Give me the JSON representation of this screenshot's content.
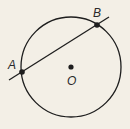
{
  "diagram": {
    "background": "#f3efe6",
    "stroke": "#1e1e1e",
    "circle": {
      "center_label": "O",
      "cx": 71,
      "cy": 67,
      "r": 50
    },
    "line": {
      "x1": 9,
      "y1": 80,
      "x2": 109,
      "y2": 17
    },
    "points": [
      {
        "label": "A",
        "x": 22,
        "y": 72,
        "label_x": 12,
        "label_y": 67
      },
      {
        "label": "B",
        "x": 97,
        "y": 25,
        "label_x": 97,
        "label_y": 14
      },
      {
        "label": "O",
        "x": 71,
        "y": 67,
        "label_x": 71,
        "label_y": 84
      }
    ]
  }
}
